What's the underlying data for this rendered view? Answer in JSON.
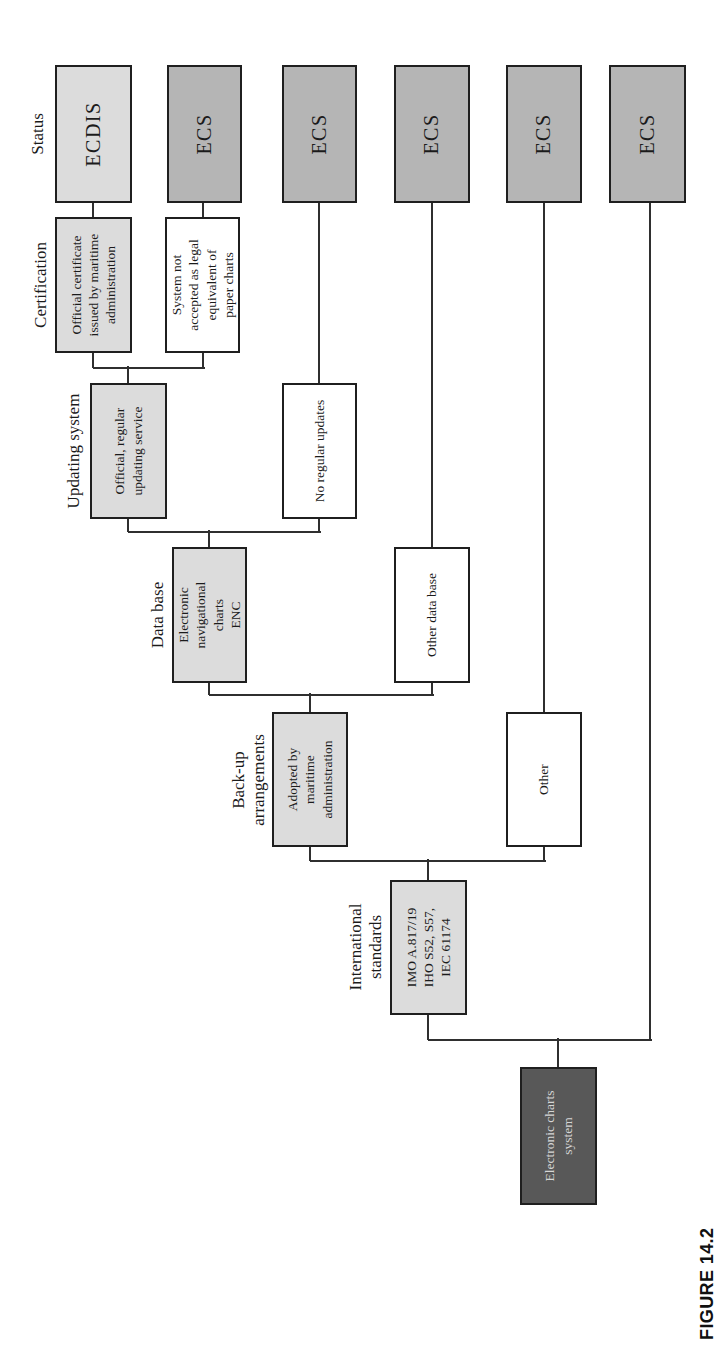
{
  "caption": "FIGURE 14.2",
  "colors": {
    "bg": "#ffffff",
    "light": "#dcdcdc",
    "medium": "#b5b5b5",
    "dark": "#585858",
    "white": "#ffffff",
    "border": "#1f1f1f",
    "line": "#2f2f2f",
    "text": "#1b1b1b",
    "textOnDark": "#d6d6d6"
  },
  "headers": [
    {
      "id": "status",
      "text": "Status",
      "u": 1212,
      "v": 28
    },
    {
      "id": "certification",
      "text": "Certification",
      "u": 1061,
      "v": 31
    },
    {
      "id": "updating-system",
      "text": "Updating system",
      "u": 895,
      "v": 64
    },
    {
      "id": "data-base",
      "text": "Data base",
      "u": 731,
      "v": 148
    },
    {
      "id": "back-up-arrangements",
      "text": "Back-up\narrangements",
      "u": 566,
      "v": 229
    },
    {
      "id": "international-standards",
      "text": "International\nstandards",
      "u": 399,
      "v": 346
    }
  ],
  "nodes": [
    {
      "id": "electronic-charts-system",
      "label": "Electronic charts\nsystem",
      "style": "dark",
      "u": 141,
      "v": 520,
      "w": 138,
      "h": 77
    },
    {
      "id": "international-standards",
      "label": "IMO A.817/19\nIHO S52, S57,\nIEC 61174",
      "style": "light",
      "u": 331,
      "v": 390,
      "w": 135,
      "h": 77
    },
    {
      "id": "adopted-by-maritime-administration",
      "label": "Adopted by\nmaritime\nadministration",
      "style": "light",
      "u": 499,
      "v": 272,
      "w": 135,
      "h": 76
    },
    {
      "id": "backup-other",
      "label": "Other",
      "style": "white",
      "u": 499,
      "v": 506,
      "w": 135,
      "h": 76
    },
    {
      "id": "electronic-navigational-charts-enc",
      "label": "Electronic\nnavigational\ncharts\nENC",
      "style": "light",
      "u": 663,
      "v": 172,
      "w": 136,
      "h": 75
    },
    {
      "id": "other-data-base",
      "label": "Other data base",
      "style": "white",
      "u": 663,
      "v": 394,
      "w": 136,
      "h": 76
    },
    {
      "id": "official-regular-updating-service",
      "label": "Official, regular\nupdating service",
      "style": "light",
      "u": 827,
      "v": 90,
      "w": 136,
      "h": 77
    },
    {
      "id": "no-regular-updates",
      "label": "No regular updates",
      "style": "white",
      "u": 827,
      "v": 282,
      "w": 136,
      "h": 75
    },
    {
      "id": "official-certificate",
      "label": "Official certificate\nissued by maritime\nadministration",
      "style": "light",
      "u": 993,
      "v": 55,
      "w": 136,
      "h": 77
    },
    {
      "id": "system-not-accepted",
      "label": "System not\naccepted as legal\nequivalent of\npaper charts",
      "style": "white",
      "u": 993,
      "v": 165,
      "w": 136,
      "h": 75
    },
    {
      "id": "status-ecdis",
      "label": "ECDIS",
      "style": "light status",
      "u": 1143,
      "v": 55,
      "w": 138,
      "h": 77
    },
    {
      "id": "status-ecs-2",
      "label": "ECS",
      "style": "medium status",
      "u": 1143,
      "v": 167,
      "w": 138,
      "h": 75
    },
    {
      "id": "status-ecs-3",
      "label": "ECS",
      "style": "medium status",
      "u": 1143,
      "v": 282,
      "w": 138,
      "h": 75
    },
    {
      "id": "status-ecs-4",
      "label": "ECS",
      "style": "medium status",
      "u": 1143,
      "v": 394,
      "w": 138,
      "h": 76
    },
    {
      "id": "status-ecs-5",
      "label": "ECS",
      "style": "medium status",
      "u": 1143,
      "v": 506,
      "w": 138,
      "h": 76
    },
    {
      "id": "status-ecs-6",
      "label": "ECS",
      "style": "medium status",
      "u": 1143,
      "v": 609,
      "w": 138,
      "h": 77
    }
  ],
  "edges": [
    {
      "points": [
        [
          279,
          558
        ],
        [
          306,
          558
        ]
      ]
    },
    {
      "points": [
        [
          306,
          428
        ],
        [
          306,
          650
        ]
      ]
    },
    {
      "points": [
        [
          306,
          428
        ],
        [
          331,
          428
        ]
      ]
    },
    {
      "points": [
        [
          306,
          650
        ],
        [
          1143,
          650
        ]
      ]
    },
    {
      "points": [
        [
          466,
          428
        ],
        [
          485,
          428
        ]
      ]
    },
    {
      "points": [
        [
          485,
          310
        ],
        [
          485,
          544
        ]
      ]
    },
    {
      "points": [
        [
          485,
          310
        ],
        [
          499,
          310
        ]
      ]
    },
    {
      "points": [
        [
          485,
          544
        ],
        [
          499,
          544
        ]
      ]
    },
    {
      "points": [
        [
          634,
          310
        ],
        [
          651,
          310
        ]
      ]
    },
    {
      "points": [
        [
          651,
          209
        ],
        [
          651,
          432
        ]
      ]
    },
    {
      "points": [
        [
          651,
          209
        ],
        [
          663,
          209
        ]
      ]
    },
    {
      "points": [
        [
          651,
          432
        ],
        [
          663,
          432
        ]
      ]
    },
    {
      "points": [
        [
          799,
          209
        ],
        [
          814,
          209
        ]
      ]
    },
    {
      "points": [
        [
          814,
          128
        ],
        [
          814,
          319
        ]
      ]
    },
    {
      "points": [
        [
          814,
          128
        ],
        [
          827,
          128
        ]
      ]
    },
    {
      "points": [
        [
          814,
          319
        ],
        [
          827,
          319
        ]
      ]
    },
    {
      "points": [
        [
          963,
          128
        ],
        [
          978,
          128
        ]
      ]
    },
    {
      "points": [
        [
          978,
          93
        ],
        [
          978,
          203
        ]
      ]
    },
    {
      "points": [
        [
          978,
          93
        ],
        [
          993,
          93
        ]
      ]
    },
    {
      "points": [
        [
          978,
          203
        ],
        [
          993,
          203
        ]
      ]
    },
    {
      "points": [
        [
          1129,
          93
        ],
        [
          1143,
          93
        ]
      ]
    },
    {
      "points": [
        [
          1129,
          203
        ],
        [
          1143,
          203
        ]
      ]
    },
    {
      "points": [
        [
          963,
          319
        ],
        [
          1143,
          319
        ]
      ]
    },
    {
      "points": [
        [
          799,
          432
        ],
        [
          1143,
          432
        ]
      ]
    },
    {
      "points": [
        [
          634,
          544
        ],
        [
          1143,
          544
        ]
      ]
    }
  ]
}
